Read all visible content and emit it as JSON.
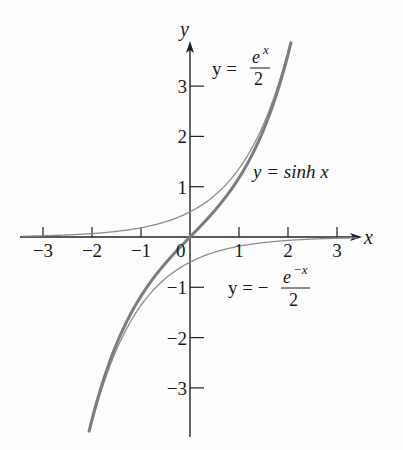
{
  "chart_data": {
    "type": "line",
    "title": "",
    "xlabel": "x",
    "ylabel": "y",
    "xlim": [
      -3.4,
      3.4
    ],
    "ylim": [
      -4,
      3.9
    ],
    "x_ticks": [
      -3,
      -2,
      -1,
      0,
      1,
      2,
      3
    ],
    "x_tick_labels": [
      "−3",
      "−2",
      "−1",
      "0",
      "1",
      "2",
      "3"
    ],
    "y_ticks": [
      -3,
      -2,
      -1,
      1,
      2,
      3
    ],
    "y_tick_labels": [
      "−3",
      "−2",
      "−1",
      "1",
      "2",
      "3"
    ],
    "grid": false,
    "series": [
      {
        "name": "y = e^x / 2",
        "style": "thin",
        "color": "#8a8a8a",
        "x": [
          -3,
          -2,
          -1,
          0,
          1,
          2,
          2.04
        ],
        "values": [
          0.025,
          0.068,
          0.184,
          0.5,
          1.359,
          3.695,
          3.85
        ]
      },
      {
        "name": "y = −e^(−x) / 2",
        "style": "thin",
        "color": "#8a8a8a",
        "x": [
          -2.04,
          -2,
          -1,
          0,
          1,
          2,
          3
        ],
        "values": [
          -3.85,
          -3.695,
          -1.359,
          -0.5,
          -0.184,
          -0.068,
          -0.025
        ]
      },
      {
        "name": "y = sinh x",
        "style": "thick",
        "color": "#7a7a7a",
        "x": [
          -2.06,
          -2,
          -1,
          0,
          1,
          2,
          2.06
        ],
        "values": [
          -3.89,
          -3.627,
          -1.175,
          0,
          1.175,
          3.627,
          3.89
        ]
      }
    ],
    "annotations": [
      {
        "text": "y = e^x / 2",
        "near": [
          0.6,
          3.1
        ]
      },
      {
        "text": "y = sinh x",
        "near": [
          1.6,
          1.25
        ]
      },
      {
        "text": "y = −e^(−x) / 2",
        "near": [
          1.3,
          -1.1
        ]
      }
    ]
  },
  "labels": {
    "x_axis": "x",
    "y_axis": "y",
    "origin": "0",
    "ann1_lhs": "y =",
    "ann1_num": "e",
    "ann1_sup": "x",
    "ann1_den": "2",
    "ann2": "y = sinh x",
    "ann3_lhs": "y = −",
    "ann3_num": "e",
    "ann3_sup": "−x",
    "ann3_den": "2"
  }
}
